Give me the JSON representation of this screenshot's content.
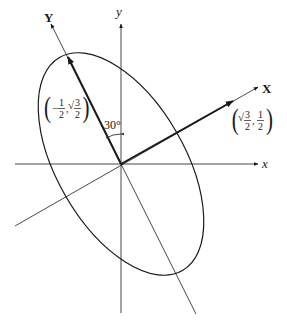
{
  "diagram": {
    "type": "rotated-ellipse-axes",
    "axes": {
      "x_label": "x",
      "y_label": "y",
      "rotated_x_label": "X",
      "rotated_y_label": "Y"
    },
    "angle_label": "30°",
    "points": {
      "y_unit_vector": {
        "open": "(",
        "sign": "−",
        "num1": "1",
        "den1": "2",
        "sep": ",",
        "root": "√",
        "num2": "3",
        "den2": "2",
        "close": ")"
      },
      "x_unit_vector": {
        "open": "(",
        "root": "√",
        "num1": "3",
        "den1": "2",
        "sep": ",",
        "num2": "1",
        "den2": "2",
        "close": ")"
      }
    },
    "colors": {
      "line": "#1a1a1a",
      "background": "#ffffff"
    }
  }
}
